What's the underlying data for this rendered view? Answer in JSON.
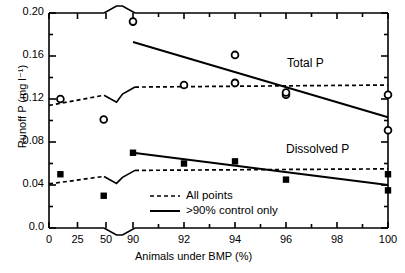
{
  "chart_data": {
    "type": "scatter",
    "title": "",
    "xlabel": "Animals under BMP (%)",
    "ylabel": "Runoff P (mg l⁻¹)",
    "xlim": [
      0,
      100
    ],
    "ylim": [
      0.0,
      0.2
    ],
    "axis_break": {
      "x": [
        50,
        90
      ],
      "note": "broken x-axis between 50 and 90"
    },
    "grid": false,
    "xticks": [
      0,
      25,
      50,
      90,
      92,
      94,
      96,
      98,
      100
    ],
    "xticklabels": [
      "0",
      "25",
      "50",
      "90",
      "92",
      "94",
      "96",
      "98",
      "100"
    ],
    "yticks": [
      0.0,
      0.04,
      0.08,
      0.12,
      0.16,
      0.2
    ],
    "yticklabels": [
      "0.0",
      "0.04",
      "0.08",
      "0.12",
      "0.16",
      "0.20"
    ],
    "yminorticks": [
      0.02,
      0.06,
      0.1,
      0.14,
      0.18
    ],
    "series": [
      {
        "name": "Total P",
        "marker": "open-circle",
        "points": [
          {
            "x": 10,
            "y": 0.12
          },
          {
            "x": 48,
            "y": 0.101
          },
          {
            "x": 90,
            "y": 0.192
          },
          {
            "x": 92,
            "y": 0.133
          },
          {
            "x": 94,
            "y": 0.161
          },
          {
            "x": 94,
            "y": 0.135
          },
          {
            "x": 96,
            "y": 0.124
          },
          {
            "x": 96,
            "y": 0.126
          },
          {
            "x": 100,
            "y": 0.124
          },
          {
            "x": 100,
            "y": 0.091
          }
        ]
      },
      {
        "name": "Dissolved P",
        "marker": "filled-square",
        "points": [
          {
            "x": 10,
            "y": 0.05
          },
          {
            "x": 48,
            "y": 0.03
          },
          {
            "x": 90,
            "y": 0.07
          },
          {
            "x": 92,
            "y": 0.06
          },
          {
            "x": 94,
            "y": 0.062
          },
          {
            "x": 96,
            "y": 0.045
          },
          {
            "x": 100,
            "y": 0.05
          },
          {
            "x": 100,
            "y": 0.035
          }
        ]
      }
    ],
    "trendlines": [
      {
        "name": "Total P - all points",
        "style": "dashed",
        "from": {
          "x": 0,
          "y": 0.114
        },
        "to": {
          "x": 100,
          "y": 0.133
        }
      },
      {
        "name": "Total P - >90% control only",
        "style": "solid",
        "from": {
          "x": 90,
          "y": 0.173
        },
        "to": {
          "x": 100,
          "y": 0.103
        }
      },
      {
        "name": "Dissolved P - all points",
        "style": "dashed",
        "from": {
          "x": 0,
          "y": 0.041
        },
        "to": {
          "x": 100,
          "y": 0.055
        }
      },
      {
        "name": "Dissolved P - >90% control only",
        "style": "solid",
        "from": {
          "x": 90,
          "y": 0.07
        },
        "to": {
          "x": 100,
          "y": 0.04
        }
      }
    ],
    "annotations": [
      {
        "text": "Total P",
        "x": 96.1,
        "y": 0.152
      },
      {
        "text": "Dissolved P",
        "x": 96.3,
        "y": 0.07
      }
    ],
    "legend": {
      "position": "bottom-center-left",
      "entries": [
        {
          "label": "All points",
          "style": "dashed"
        },
        {
          "label": ">90% control only",
          "style": "solid"
        }
      ]
    }
  }
}
